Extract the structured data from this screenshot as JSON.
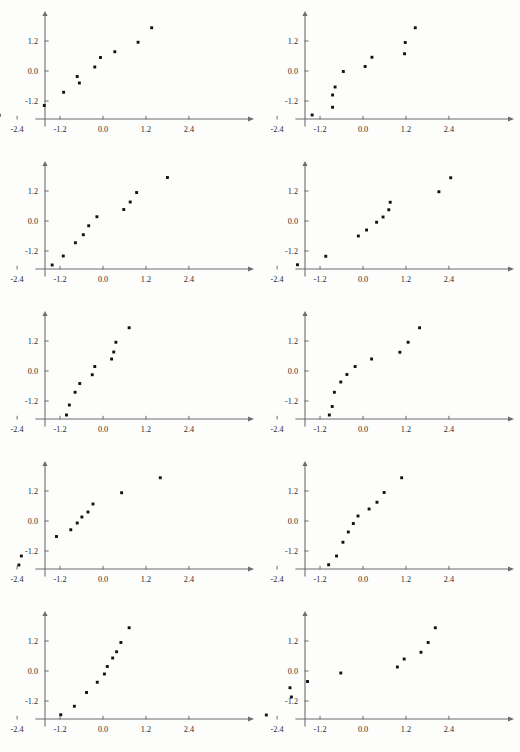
{
  "figure": {
    "kind": "normal-probability-plot-grid",
    "rows": 5,
    "cols": 2,
    "panel_width": 260,
    "panel_height": 150,
    "point_color": "#111111",
    "axis_color": "#6d6d6d",
    "background_color": "#fdfdfc"
  },
  "axes": {
    "x_ticks": [
      "-2.4",
      "-1.2",
      "0.0",
      "1.2",
      "2.4"
    ],
    "x_tick_values": [
      -2.4,
      -1.2,
      0.0,
      1.2,
      2.4
    ],
    "y_ticks": [
      "1.2",
      "0.0",
      "-1.2"
    ],
    "y_tick_values": [
      1.2,
      0.0,
      -1.2
    ],
    "xlim": [
      -3.3,
      3.3
    ],
    "ylim": [
      -2.35,
      2.35
    ],
    "grid": false,
    "legend": null,
    "xlabel": "",
    "ylabel": ""
  },
  "chart_data": [
    {
      "type": "scatter",
      "title": "",
      "panel": 1,
      "position": "row1-left",
      "xlabel": "",
      "ylabel": "",
      "xlim": [
        -3.3,
        3.3
      ],
      "ylim": [
        -2.35,
        2.35
      ],
      "xticks": [
        -2.4,
        -1.2,
        0.0,
        1.2,
        2.4
      ],
      "yticks": [
        -1.2,
        0.0,
        1.2
      ],
      "grid": false,
      "x": [
        -2.9,
        -1.64,
        -1.1,
        -0.72,
        -0.66,
        -0.23,
        -0.07,
        0.33,
        0.98,
        1.36
      ],
      "y": [
        -1.77,
        -1.38,
        -0.85,
        -0.22,
        -0.48,
        0.16,
        0.54,
        0.77,
        1.15,
        1.73
      ]
    },
    {
      "type": "scatter",
      "title": "",
      "panel": 2,
      "position": "row1-right",
      "xlabel": "",
      "ylabel": "",
      "xlim": [
        -3.3,
        3.3
      ],
      "ylim": [
        -2.35,
        2.35
      ],
      "xticks": [
        -2.4,
        -1.2,
        0.0,
        1.2,
        2.4
      ],
      "yticks": [
        -1.2,
        0.0,
        1.2
      ],
      "grid": false,
      "x": [
        -1.42,
        -0.85,
        -0.85,
        -0.78,
        -0.55,
        0.06,
        0.25,
        1.16,
        1.18,
        1.46
      ],
      "y": [
        -1.76,
        -1.45,
        -0.96,
        -0.64,
        -0.02,
        0.18,
        0.55,
        0.69,
        1.14,
        1.73
      ]
    },
    {
      "type": "scatter",
      "title": "",
      "panel": 3,
      "position": "row2-left",
      "xlabel": "",
      "ylabel": "",
      "xlim": [
        -3.3,
        3.3
      ],
      "ylim": [
        -2.35,
        2.35
      ],
      "xticks": [
        -2.4,
        -1.2,
        0.0,
        1.2,
        2.4
      ],
      "yticks": [
        -1.2,
        0.0,
        1.2
      ],
      "grid": false,
      "x": [
        -1.42,
        -1.11,
        -0.77,
        -0.55,
        -0.4,
        -0.17,
        0.58,
        0.76,
        0.94,
        1.8
      ],
      "y": [
        -1.76,
        -1.4,
        -0.87,
        -0.55,
        -0.19,
        0.17,
        0.46,
        0.76,
        1.14,
        1.74
      ]
    },
    {
      "type": "scatter",
      "title": "",
      "panel": 4,
      "position": "row2-right",
      "xlabel": "",
      "ylabel": "",
      "xlim": [
        -3.3,
        3.3
      ],
      "ylim": [
        -2.35,
        2.35
      ],
      "xticks": [
        -2.4,
        -1.2,
        0.0,
        1.2,
        2.4
      ],
      "yticks": [
        -1.2,
        0.0,
        1.2
      ],
      "grid": false,
      "x": [
        -1.83,
        -1.04,
        -0.13,
        0.1,
        0.38,
        0.56,
        0.72,
        0.76,
        2.12,
        2.45
      ],
      "y": [
        -1.75,
        -1.41,
        -0.6,
        -0.36,
        -0.05,
        0.16,
        0.45,
        0.75,
        1.17,
        1.73
      ]
    },
    {
      "type": "scatter",
      "title": "",
      "panel": 5,
      "position": "row3-left",
      "xlabel": "",
      "ylabel": "",
      "xlim": [
        -3.3,
        3.3
      ],
      "ylim": [
        -2.35,
        2.35
      ],
      "xticks": [
        -2.4,
        -1.2,
        0.0,
        1.2,
        2.4
      ],
      "yticks": [
        -1.2,
        0.0,
        1.2
      ],
      "grid": false,
      "x": [
        -1.02,
        -0.94,
        -0.78,
        -0.65,
        -0.3,
        -0.23,
        0.24,
        0.3,
        0.36,
        0.73
      ],
      "y": [
        -1.76,
        -1.36,
        -0.85,
        -0.5,
        -0.15,
        0.18,
        0.48,
        0.76,
        1.15,
        1.73
      ]
    },
    {
      "type": "scatter",
      "title": "",
      "panel": 6,
      "position": "row3-right",
      "xlabel": "",
      "ylabel": "",
      "xlim": [
        -3.3,
        3.3
      ],
      "ylim": [
        -2.35,
        2.35
      ],
      "xticks": [
        -2.4,
        -1.2,
        0.0,
        1.2,
        2.4
      ],
      "yticks": [
        -1.2,
        0.0,
        1.2
      ],
      "grid": false,
      "x": [
        -0.94,
        -0.86,
        -0.8,
        -0.62,
        -0.45,
        -0.22,
        0.24,
        1.03,
        1.26,
        1.58
      ],
      "y": [
        -1.76,
        -1.42,
        -0.85,
        -0.44,
        -0.14,
        0.18,
        0.48,
        0.75,
        1.15,
        1.73
      ]
    },
    {
      "type": "scatter",
      "title": "",
      "panel": 7,
      "position": "row4-left",
      "xlabel": "",
      "ylabel": "",
      "xlim": [
        -3.3,
        3.3
      ],
      "ylim": [
        -2.35,
        2.35
      ],
      "xticks": [
        -2.4,
        -1.2,
        0.0,
        1.2,
        2.4
      ],
      "yticks": [
        -1.2,
        0.0,
        1.2
      ],
      "grid": false,
      "x": [
        -2.35,
        -2.28,
        -1.3,
        -0.9,
        -0.72,
        -0.59,
        -0.42,
        -0.28,
        0.52,
        1.6
      ],
      "y": [
        -1.76,
        -1.4,
        -0.62,
        -0.35,
        -0.08,
        0.16,
        0.36,
        0.68,
        1.13,
        1.73
      ]
    },
    {
      "type": "scatter",
      "title": "",
      "panel": 8,
      "position": "row4-right",
      "xlabel": "",
      "ylabel": "",
      "xlim": [
        -3.3,
        3.3
      ],
      "ylim": [
        -2.35,
        2.35
      ],
      "xticks": [
        -2.4,
        -1.2,
        0.0,
        1.2,
        2.4
      ],
      "yticks": [
        -1.2,
        0.0,
        1.2
      ],
      "grid": false,
      "x": [
        -0.96,
        -0.74,
        -0.56,
        -0.41,
        -0.27,
        -0.14,
        0.17,
        0.39,
        0.59,
        1.08
      ],
      "y": [
        -1.75,
        -1.4,
        -0.85,
        -0.44,
        -0.1,
        0.2,
        0.48,
        0.75,
        1.14,
        1.73
      ]
    },
    {
      "type": "scatter",
      "title": "",
      "panel": 9,
      "position": "row5-left",
      "xlabel": "",
      "ylabel": "",
      "xlim": [
        -3.3,
        3.3
      ],
      "ylim": [
        -2.35,
        2.35
      ],
      "xticks": [
        -2.4,
        -1.2,
        0.0,
        1.2,
        2.4
      ],
      "yticks": [
        -1.2,
        0.0,
        1.2
      ],
      "grid": false,
      "x": [
        -1.18,
        -0.8,
        -0.46,
        -0.16,
        0.04,
        0.12,
        0.27,
        0.38,
        0.5,
        0.73
      ],
      "y": [
        -1.75,
        -1.41,
        -0.86,
        -0.45,
        -0.12,
        0.18,
        0.52,
        0.77,
        1.14,
        1.73
      ]
    },
    {
      "type": "scatter",
      "title": "",
      "panel": 10,
      "position": "row5-right",
      "xlabel": "",
      "ylabel": "",
      "xlim": [
        -3.3,
        3.3
      ],
      "ylim": [
        -2.35,
        2.35
      ],
      "xticks": [
        -2.4,
        -1.2,
        0.0,
        1.2,
        2.4
      ],
      "yticks": [
        -1.2,
        0.0,
        1.2
      ],
      "grid": false,
      "x": [
        -2.7,
        -2.04,
        -2.0,
        -1.55,
        -0.62,
        0.96,
        1.15,
        1.62,
        1.82,
        2.02
      ],
      "y": [
        -1.76,
        -0.67,
        -1.04,
        -0.42,
        -0.08,
        0.16,
        0.48,
        0.75,
        1.14,
        1.73
      ]
    }
  ]
}
